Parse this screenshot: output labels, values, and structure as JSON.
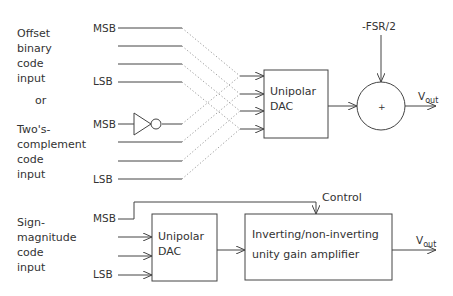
{
  "diagram": {
    "groups": {
      "offset_binary": {
        "lines": [
          "Offset",
          "binary",
          "code",
          "input"
        ]
      },
      "or_label": "or",
      "twos_complement": {
        "lines": [
          "Two's-",
          "complement",
          "code",
          "input"
        ]
      },
      "sign_magnitude": {
        "lines": [
          "Sign-",
          "magnitude",
          "code",
          "input"
        ]
      }
    },
    "bit_labels": {
      "msb": "MSB",
      "lsb": "LSB"
    },
    "top": {
      "dac_label": [
        "Unipolar",
        "DAC"
      ],
      "offset_input": "-FSR/2",
      "summer_sign": "+",
      "output": {
        "main": "V",
        "sub": "out"
      }
    },
    "bottom": {
      "dac_label": [
        "Unipolar",
        "DAC"
      ],
      "control_label": "Control",
      "amp_label": [
        "Inverting/non-inverting",
        "unity gain amplifier"
      ],
      "output": {
        "main": "V",
        "sub": "out"
      }
    }
  }
}
